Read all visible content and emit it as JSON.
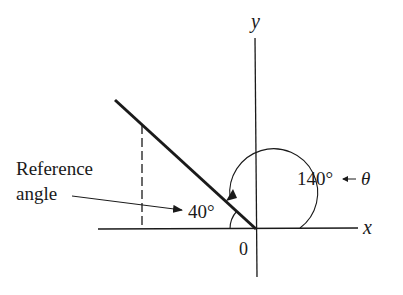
{
  "diagram": {
    "type": "reference-angle",
    "axes": {
      "x_label": "x",
      "y_label": "y",
      "origin_label": "0"
    },
    "angle_theta": {
      "value": "140°",
      "symbol": "θ",
      "label": "140° ← θ"
    },
    "reference_angle": {
      "value": "40°",
      "caption_line1": "Reference",
      "caption_line2": "angle"
    },
    "colors": {
      "ink": "#1a1a1a",
      "background": "#ffffff"
    }
  }
}
